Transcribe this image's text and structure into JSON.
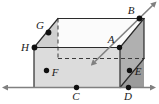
{
  "figure": {
    "type": "geometry-diagram",
    "width": 159,
    "height": 104,
    "colors": {
      "background": "#ffffff",
      "outline": "#2b2b2b",
      "front_face": "#d9d9d9",
      "top_face": "#ffffff",
      "right_face": "#b3b3b3",
      "left_face": "#d0d0d0",
      "line": "#808080",
      "dashed": "#3a3a3a",
      "point": "#111111",
      "label": "#1a1a1a"
    },
    "points": [
      {
        "name": "A",
        "label": "A",
        "x": 119.5,
        "y": 47.5,
        "label_x": 111,
        "label_y": 43
      },
      {
        "name": "B",
        "label": "B",
        "x": 139.5,
        "y": 18.5,
        "label_x": 131,
        "label_y": 14
      },
      {
        "name": "C",
        "label": "C",
        "x": 76.5,
        "y": 87.5,
        "label_x": 73,
        "label_y": 100
      },
      {
        "name": "D",
        "label": "D",
        "x": 128.5,
        "y": 87.5,
        "label_x": 125,
        "label_y": 100
      },
      {
        "name": "E",
        "label": "E",
        "x": 129.5,
        "y": 70.5,
        "label_x": 134,
        "label_y": 75
      },
      {
        "name": "F",
        "label": "F",
        "x": 46.5,
        "y": 70.5,
        "label_x": 51,
        "label_y": 75
      },
      {
        "name": "G",
        "label": "G",
        "x": 48.5,
        "y": 32.5,
        "label_x": 39,
        "label_y": 29
      },
      {
        "name": "H",
        "label": "H",
        "x": 34.5,
        "y": 47.5,
        "label_x": 24,
        "label_y": 49
      }
    ],
    "lines": [
      {
        "name": "horizontal-line-CD",
        "kind": "double-arrow",
        "through": [
          "C",
          "D"
        ],
        "x1": 8,
        "y1": 87.5,
        "x2": 151,
        "y2": 87.5
      },
      {
        "name": "diagonal-line-AB",
        "kind": "double-arrow",
        "through": [
          "A",
          "B"
        ],
        "x1": 95,
        "y1": 61.5,
        "x2": 153,
        "y2": 5
      }
    ],
    "box": {
      "front_face": "34,47.5 120,47.5 120,87.5 34,87.5",
      "top_face": "34,47.5 58,18.5 144,18.5 120,47.5",
      "right_face": "120,47.5 144,18.5 144,58.5 120,87.5",
      "hidden_vertical": {
        "x1": 58,
        "y1": 18.5,
        "x2": 58,
        "y2": 58.5
      },
      "hidden_horizontal": {
        "x1": 58,
        "y1": 58.5,
        "x2": 144,
        "y2": 58.5
      },
      "hidden_diagonal": {
        "x1": 120,
        "y1": 87.5,
        "x2": 144,
        "y2": 58.5
      }
    },
    "shaded_triangles": {
      "left_front_wedge": "34,47.5 48.5,32.5 34,32.5",
      "corner_G": "34,47.5 58,18.5 58,47.5",
      "corner_E": "120,87.5 144,58.5 144,87.5"
    }
  }
}
